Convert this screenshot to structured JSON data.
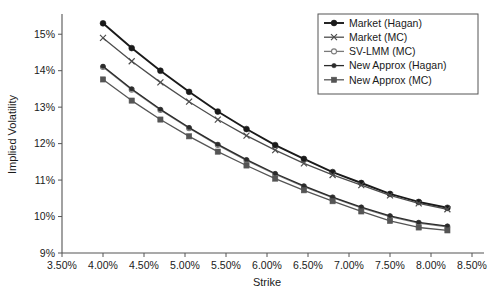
{
  "chart_data": {
    "type": "line",
    "title": "",
    "xlabel": "Strike",
    "ylabel": "Implied Volatility",
    "xlim": [
      3.5,
      8.5
    ],
    "ylim": [
      9,
      15.5
    ],
    "xticks": [
      3.5,
      4.0,
      4.5,
      5.0,
      5.5,
      6.0,
      6.5,
      7.0,
      7.5,
      8.0,
      8.5
    ],
    "xtick_labels": [
      "3.50%",
      "4.00%",
      "4.50%",
      "5.00%",
      "5.50%",
      "6.00%",
      "6.50%",
      "7.00%",
      "7.50%",
      "8.00%",
      "8.50%"
    ],
    "yticks": [
      9,
      10,
      11,
      12,
      13,
      14,
      15
    ],
    "ytick_labels": [
      "9%",
      "10%",
      "11%",
      "12%",
      "13%",
      "14%",
      "15%"
    ],
    "grid": false,
    "legend_position": "top-right",
    "x": [
      4.0,
      4.35,
      4.7,
      5.05,
      5.4,
      5.75,
      6.1,
      6.45,
      6.8,
      7.15,
      7.5,
      7.85,
      8.2
    ],
    "series": [
      {
        "name": "Market (Hagan)",
        "marker": "filled-circle",
        "color": "#1a1a1a",
        "values": [
          15.3,
          14.62,
          14.0,
          13.42,
          12.88,
          12.4,
          11.96,
          11.58,
          11.22,
          10.92,
          10.62,
          10.4,
          10.24
        ]
      },
      {
        "name": "Market (MC)",
        "marker": "cross",
        "color": "#4d4d4d",
        "values": [
          14.9,
          14.26,
          13.68,
          13.15,
          12.66,
          12.22,
          11.82,
          11.46,
          11.14,
          10.86,
          10.58,
          10.36,
          10.2
        ]
      },
      {
        "name": "SV-LMM (MC)",
        "marker": "open-circle",
        "color": "#7a7a7a",
        "values": [
          14.1,
          13.48,
          12.92,
          12.42,
          11.96,
          11.54,
          11.16,
          10.82,
          10.52,
          10.24,
          10.0,
          9.82,
          9.72
        ]
      },
      {
        "name": "New Approx (Hagan)",
        "marker": "small-filled-circle",
        "color": "#2b2b2b",
        "values": [
          14.12,
          13.5,
          12.94,
          12.44,
          11.98,
          11.56,
          11.18,
          10.84,
          10.53,
          10.26,
          10.02,
          9.84,
          9.74
        ]
      },
      {
        "name": "New Approx (MC)",
        "marker": "filled-square",
        "color": "#555555",
        "values": [
          13.76,
          13.18,
          12.66,
          12.2,
          11.78,
          11.4,
          11.04,
          10.72,
          10.42,
          10.14,
          9.88,
          9.7,
          9.62
        ]
      }
    ]
  }
}
